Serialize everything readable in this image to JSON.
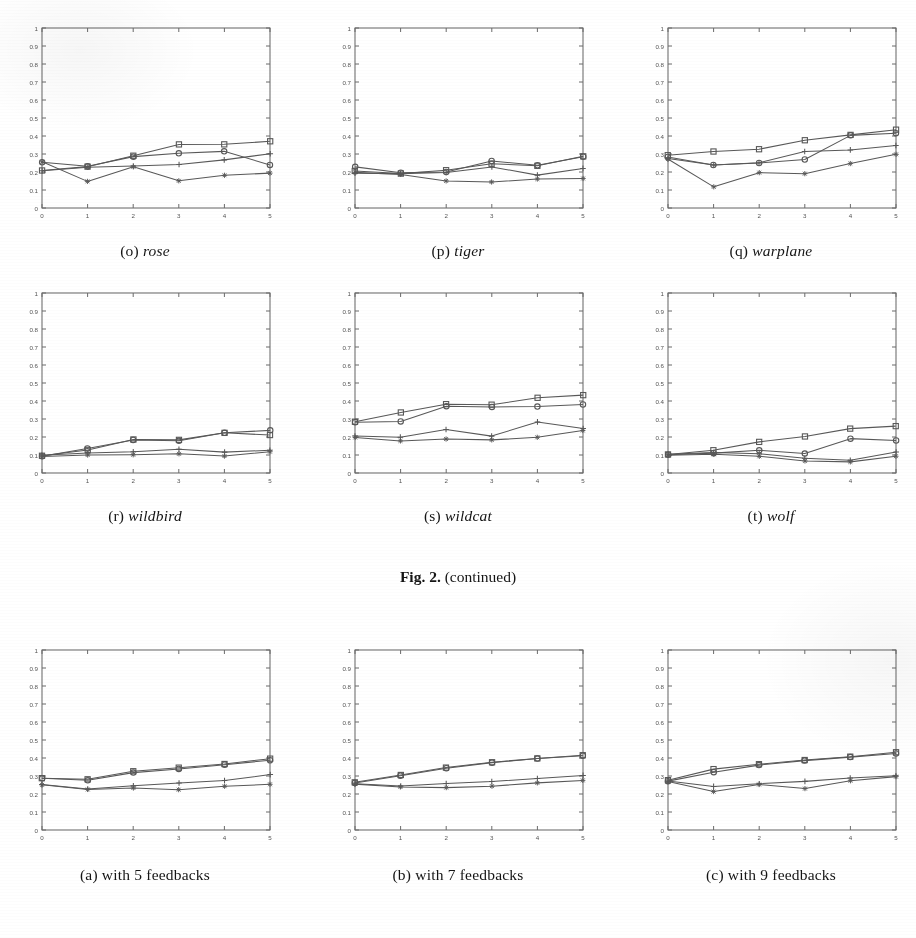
{
  "figure": {
    "label_bold": "Fig. 2.",
    "label_rest": "(continued)"
  },
  "axes_common": {
    "xlim": [
      0,
      5
    ],
    "ylim": [
      0,
      1
    ],
    "xticks": [
      "0",
      "1",
      "2",
      "3",
      "4",
      "5"
    ],
    "yticks": [
      "0",
      "0.1",
      "0.2",
      "0.3",
      "0.4",
      "0.5",
      "0.6",
      "0.7",
      "0.8",
      "0.9",
      "1"
    ],
    "grid": false,
    "legend": "none",
    "ink_color": "#585858",
    "frame_color": "#6b6b6b",
    "tick_label_color": "#555555"
  },
  "panels": [
    {
      "id": "o",
      "caption_prefix": "(o)",
      "caption_name": "rose",
      "chart_data": {
        "type": "line",
        "title": "rose",
        "xlabel": "",
        "ylabel": "",
        "xlim": [
          0,
          5
        ],
        "ylim": [
          0,
          1
        ],
        "x": [
          0,
          1,
          2,
          3,
          4,
          5
        ],
        "xticks": [
          "0",
          "1",
          "2",
          "3",
          "4",
          "5"
        ],
        "yticks": [
          "0",
          "0.1",
          "0.2",
          "0.3",
          "0.4",
          "0.5",
          "0.6",
          "0.7",
          "0.8",
          "0.9",
          "1"
        ],
        "grid": false,
        "legend": "none",
        "series": [
          {
            "name": "series-1",
            "marker": "square",
            "values": [
              0.21,
              0.23,
              0.29,
              0.355,
              0.355,
              0.372
            ]
          },
          {
            "name": "series-2",
            "marker": "circle",
            "values": [
              0.255,
              0.23,
              0.285,
              0.305,
              0.315,
              0.24
            ]
          },
          {
            "name": "series-3",
            "marker": "plus",
            "values": [
              0.205,
              0.228,
              0.232,
              0.24,
              0.268,
              0.3
            ]
          },
          {
            "name": "series-4",
            "marker": "star",
            "values": [
              0.255,
              0.148,
              0.228,
              0.152,
              0.182,
              0.192
            ]
          }
        ]
      }
    },
    {
      "id": "p",
      "caption_prefix": "(p)",
      "caption_name": "tiger",
      "chart_data": {
        "type": "line",
        "title": "tiger",
        "xlabel": "",
        "ylabel": "",
        "xlim": [
          0,
          5
        ],
        "ylim": [
          0,
          1
        ],
        "x": [
          0,
          1,
          2,
          3,
          4,
          5
        ],
        "xticks": [
          "0",
          "1",
          "2",
          "3",
          "4",
          "5"
        ],
        "yticks": [
          "0",
          "0.1",
          "0.2",
          "0.3",
          "0.4",
          "0.5",
          "0.6",
          "0.7",
          "0.8",
          "0.9",
          "1"
        ],
        "grid": false,
        "legend": "none",
        "series": [
          {
            "name": "series-1",
            "marker": "square",
            "values": [
              0.205,
              0.192,
              0.21,
              0.248,
              0.235,
              0.288
            ]
          },
          {
            "name": "series-2",
            "marker": "circle",
            "values": [
              0.228,
              0.196,
              0.2,
              0.26,
              0.238,
              0.285
            ]
          },
          {
            "name": "series-3",
            "marker": "plus",
            "values": [
              0.195,
              0.19,
              0.198,
              0.228,
              0.182,
              0.218
            ]
          },
          {
            "name": "series-4",
            "marker": "star",
            "values": [
              0.2,
              0.185,
              0.152,
              0.145,
              0.162,
              0.165
            ]
          }
        ]
      }
    },
    {
      "id": "q",
      "caption_prefix": "(q)",
      "caption_name": "warplane",
      "chart_data": {
        "type": "line",
        "title": "warplane",
        "xlabel": "",
        "ylabel": "",
        "xlim": [
          0,
          5
        ],
        "ylim": [
          0,
          1
        ],
        "x": [
          0,
          1,
          2,
          3,
          4,
          5
        ],
        "xticks": [
          "0",
          "1",
          "2",
          "3",
          "4",
          "5"
        ],
        "yticks": [
          "0",
          "0.1",
          "0.2",
          "0.3",
          "0.4",
          "0.5",
          "0.6",
          "0.7",
          "0.8",
          "0.9",
          "1"
        ],
        "grid": false,
        "legend": "none",
        "series": [
          {
            "name": "series-1",
            "marker": "square",
            "values": [
              0.295,
              0.315,
              0.325,
              0.378,
              0.405,
              0.435
            ]
          },
          {
            "name": "series-2",
            "marker": "circle",
            "values": [
              0.285,
              0.24,
              0.248,
              0.268,
              0.405,
              0.415
            ]
          },
          {
            "name": "series-3",
            "marker": "plus",
            "values": [
              0.275,
              0.238,
              0.252,
              0.315,
              0.322,
              0.348
            ]
          },
          {
            "name": "series-4",
            "marker": "star",
            "values": [
              0.272,
              0.118,
              0.198,
              0.192,
              0.245,
              0.298
            ]
          }
        ]
      }
    },
    {
      "id": "r",
      "caption_prefix": "(r)",
      "caption_name": "wildbird",
      "chart_data": {
        "type": "line",
        "title": "wildbird",
        "xlabel": "",
        "ylabel": "",
        "xlim": [
          0,
          5
        ],
        "ylim": [
          0,
          1
        ],
        "x": [
          0,
          1,
          2,
          3,
          4,
          5
        ],
        "xticks": [
          "0",
          "1",
          "2",
          "3",
          "4",
          "5"
        ],
        "yticks": [
          "0",
          "0.1",
          "0.2",
          "0.3",
          "0.4",
          "0.5",
          "0.6",
          "0.7",
          "0.8",
          "0.9",
          "1"
        ],
        "grid": false,
        "legend": "none",
        "series": [
          {
            "name": "series-1",
            "marker": "square",
            "values": [
              0.095,
              0.128,
              0.188,
              0.182,
              0.222,
              0.212
            ]
          },
          {
            "name": "series-2",
            "marker": "circle",
            "values": [
              0.092,
              0.138,
              0.185,
              0.18,
              0.222,
              0.235
            ]
          },
          {
            "name": "series-3",
            "marker": "plus",
            "values": [
              0.098,
              0.112,
              0.118,
              0.132,
              0.118,
              0.128
            ]
          },
          {
            "name": "series-4",
            "marker": "star",
            "values": [
              0.09,
              0.098,
              0.102,
              0.105,
              0.096,
              0.118
            ]
          }
        ]
      }
    },
    {
      "id": "s",
      "caption_prefix": "(s)",
      "caption_name": "wildcat",
      "chart_data": {
        "type": "line",
        "title": "wildcat",
        "xlabel": "",
        "ylabel": "",
        "xlim": [
          0,
          5
        ],
        "ylim": [
          0,
          1
        ],
        "x": [
          0,
          1,
          2,
          3,
          4,
          5
        ],
        "xticks": [
          "0",
          "1",
          "2",
          "3",
          "4",
          "5"
        ],
        "yticks": [
          "0",
          "0.1",
          "0.2",
          "0.3",
          "0.4",
          "0.5",
          "0.6",
          "0.7",
          "0.8",
          "0.9",
          "1"
        ],
        "grid": false,
        "legend": "none",
        "series": [
          {
            "name": "series-1",
            "marker": "square",
            "values": [
              0.285,
              0.335,
              0.382,
              0.378,
              0.418,
              0.432
            ]
          },
          {
            "name": "series-2",
            "marker": "circle",
            "values": [
              0.282,
              0.288,
              0.372,
              0.368,
              0.368,
              0.382
            ]
          },
          {
            "name": "series-3",
            "marker": "plus",
            "values": [
              0.205,
              0.198,
              0.242,
              0.205,
              0.282,
              0.248
            ]
          },
          {
            "name": "series-4",
            "marker": "star",
            "values": [
              0.198,
              0.178,
              0.188,
              0.182,
              0.198,
              0.238
            ]
          }
        ]
      }
    },
    {
      "id": "t",
      "caption_prefix": "(t)",
      "caption_name": "wolf",
      "chart_data": {
        "type": "line",
        "title": "wolf",
        "xlabel": "",
        "ylabel": "",
        "xlim": [
          0,
          5
        ],
        "ylim": [
          0,
          1
        ],
        "x": [
          0,
          1,
          2,
          3,
          4,
          5
        ],
        "xticks": [
          "0",
          "1",
          "2",
          "3",
          "4",
          "5"
        ],
        "yticks": [
          "0",
          "0.1",
          "0.2",
          "0.3",
          "0.4",
          "0.5",
          "0.6",
          "0.7",
          "0.8",
          "0.9",
          "1"
        ],
        "grid": false,
        "legend": "none",
        "series": [
          {
            "name": "series-1",
            "marker": "square",
            "values": [
              0.102,
              0.128,
              0.172,
              0.205,
              0.245,
              0.262
            ]
          },
          {
            "name": "series-2",
            "marker": "circle",
            "values": [
              0.1,
              0.112,
              0.125,
              0.108,
              0.192,
              0.182
            ]
          },
          {
            "name": "series-3",
            "marker": "plus",
            "values": [
              0.102,
              0.112,
              0.108,
              0.082,
              0.072,
              0.118
            ]
          },
          {
            "name": "series-4",
            "marker": "star",
            "values": [
              0.1,
              0.105,
              0.092,
              0.068,
              0.062,
              0.095
            ]
          }
        ]
      }
    },
    {
      "id": "a",
      "caption_prefix": "(a)",
      "caption_name": "with 5 feedbacks",
      "chart_data": {
        "type": "line",
        "title": "with 5 feedbacks",
        "xlabel": "",
        "ylabel": "",
        "xlim": [
          0,
          5
        ],
        "ylim": [
          0,
          1
        ],
        "x": [
          0,
          1,
          2,
          3,
          4,
          5
        ],
        "xticks": [
          "0",
          "1",
          "2",
          "3",
          "4",
          "5"
        ],
        "yticks": [
          "0",
          "0.1",
          "0.2",
          "0.3",
          "0.4",
          "0.5",
          "0.6",
          "0.7",
          "0.8",
          "0.9",
          "1"
        ],
        "grid": false,
        "legend": "none",
        "series": [
          {
            "name": "series-1",
            "marker": "square",
            "values": [
              0.288,
              0.282,
              0.325,
              0.348,
              0.368,
              0.398
            ]
          },
          {
            "name": "series-2",
            "marker": "circle",
            "values": [
              0.288,
              0.278,
              0.318,
              0.338,
              0.362,
              0.388
            ]
          },
          {
            "name": "series-3",
            "marker": "plus",
            "values": [
              0.252,
              0.228,
              0.245,
              0.262,
              0.275,
              0.308
            ]
          },
          {
            "name": "series-4",
            "marker": "star",
            "values": [
              0.25,
              0.225,
              0.235,
              0.222,
              0.242,
              0.255
            ]
          }
        ]
      }
    },
    {
      "id": "b",
      "caption_prefix": "(b)",
      "caption_name": "with 7 feedbacks",
      "chart_data": {
        "type": "line",
        "title": "with 7 feedbacks",
        "xlabel": "",
        "ylabel": "",
        "xlim": [
          0,
          5
        ],
        "ylim": [
          0,
          1
        ],
        "x": [
          0,
          1,
          2,
          3,
          4,
          5
        ],
        "xticks": [
          "0",
          "1",
          "2",
          "3",
          "4",
          "5"
        ],
        "yticks": [
          "0",
          "0.1",
          "0.2",
          "0.3",
          "0.4",
          "0.5",
          "0.6",
          "0.7",
          "0.8",
          "0.9",
          "1"
        ],
        "grid": false,
        "legend": "none",
        "series": [
          {
            "name": "series-1",
            "marker": "square",
            "values": [
              0.265,
              0.305,
              0.348,
              0.378,
              0.398,
              0.415
            ]
          },
          {
            "name": "series-2",
            "marker": "circle",
            "values": [
              0.262,
              0.302,
              0.345,
              0.375,
              0.395,
              0.412
            ]
          },
          {
            "name": "series-3",
            "marker": "plus",
            "values": [
              0.258,
              0.245,
              0.258,
              0.268,
              0.288,
              0.302
            ]
          },
          {
            "name": "series-4",
            "marker": "star",
            "values": [
              0.255,
              0.238,
              0.235,
              0.242,
              0.262,
              0.275
            ]
          }
        ]
      }
    },
    {
      "id": "c",
      "caption_prefix": "(c)",
      "caption_name": "with 9 feedbacks",
      "chart_data": {
        "type": "line",
        "title": "with 9 feedbacks",
        "xlabel": "",
        "ylabel": "",
        "xlim": [
          0,
          5
        ],
        "ylim": [
          0,
          1
        ],
        "x": [
          0,
          1,
          2,
          3,
          4,
          5
        ],
        "xticks": [
          "0",
          "1",
          "2",
          "3",
          "4",
          "5"
        ],
        "yticks": [
          "0",
          "0.1",
          "0.2",
          "0.3",
          "0.4",
          "0.5",
          "0.6",
          "0.7",
          "0.8",
          "0.9",
          "1"
        ],
        "grid": false,
        "legend": "none",
        "series": [
          {
            "name": "series-1",
            "marker": "square",
            "values": [
              0.275,
              0.338,
              0.365,
              0.388,
              0.408,
              0.432
            ]
          },
          {
            "name": "series-2",
            "marker": "circle",
            "values": [
              0.272,
              0.322,
              0.362,
              0.385,
              0.405,
              0.425
            ]
          },
          {
            "name": "series-3",
            "marker": "plus",
            "values": [
              0.272,
              0.242,
              0.258,
              0.272,
              0.288,
              0.302
            ]
          },
          {
            "name": "series-4",
            "marker": "star",
            "values": [
              0.268,
              0.215,
              0.252,
              0.232,
              0.272,
              0.298
            ]
          }
        ]
      }
    }
  ]
}
